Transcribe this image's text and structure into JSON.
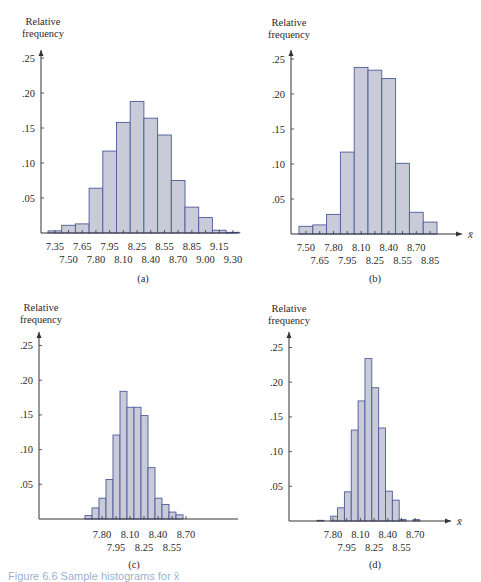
{
  "colors": {
    "bar_fill": "#c9ccd8",
    "bar_stroke": "#4a5a9c",
    "axis": "#333333",
    "caption": "#4a6fb0"
  },
  "figure_caption": "Figure 6.6 Sample histograms for x̄",
  "panels": [
    {
      "id": "a",
      "label": "(a)",
      "ylabel_line1": "Relative",
      "ylabel_line2": "frequency",
      "xsymbol": "x̄"
    },
    {
      "id": "b",
      "label": "(b)",
      "ylabel_line1": "Relative",
      "ylabel_line2": "frequency",
      "xsymbol": "x̄"
    },
    {
      "id": "c",
      "label": "(c)",
      "ylabel_line1": "Relative",
      "ylabel_line2": "frequency",
      "xsymbol": "x̄"
    },
    {
      "id": "d",
      "label": "(d)",
      "ylabel_line1": "Relative",
      "ylabel_line2": "frequency",
      "xsymbol": "x̄"
    }
  ],
  "chart_data": [
    {
      "type": "bar",
      "title": "(a)",
      "xlabel": "x̄",
      "ylabel": "Relative frequency",
      "ylim": [
        0,
        0.27
      ],
      "yticks": [
        ".05",
        ".10",
        ".15",
        ".20",
        ".25"
      ],
      "xticks_top": [
        "7.35",
        "7.65",
        "7.95",
        "8.25",
        "8.55",
        "8.85",
        "9.15"
      ],
      "xticks_bottom": [
        "7.50",
        "7.80",
        "8.10",
        "8.40",
        "8.70",
        "9.00",
        "9.30"
      ],
      "bin_start": 7.275,
      "bin_width": 0.15,
      "categories": [
        "7.35",
        "7.50",
        "7.65",
        "7.80",
        "7.95",
        "8.10",
        "8.25",
        "8.40",
        "8.55",
        "8.70",
        "8.85",
        "9.00",
        "9.15",
        "9.30"
      ],
      "values": [
        0.003,
        0.011,
        0.013,
        0.064,
        0.117,
        0.158,
        0.188,
        0.164,
        0.14,
        0.075,
        0.037,
        0.022,
        0.004,
        0.001
      ]
    },
    {
      "type": "bar",
      "title": "(b)",
      "xlabel": "x̄",
      "ylabel": "Relative frequency",
      "ylim": [
        0,
        0.27
      ],
      "yticks": [
        ".05",
        ".10",
        ".15",
        ".20",
        ".25"
      ],
      "xticks_top": [
        "7.50",
        "7.80",
        "8.10",
        "8.40",
        "8.70"
      ],
      "xticks_bottom": [
        "7.65",
        "7.95",
        "8.25",
        "8.55",
        "8.85"
      ],
      "bin_start": 7.425,
      "bin_width": 0.15,
      "categories": [
        "7.50",
        "7.65",
        "7.80",
        "7.95",
        "8.10",
        "8.25",
        "8.40",
        "8.55",
        "8.70",
        "8.85"
      ],
      "values": [
        0.011,
        0.013,
        0.028,
        0.117,
        0.238,
        0.234,
        0.222,
        0.101,
        0.031,
        0.017
      ]
    },
    {
      "type": "bar",
      "title": "(c)",
      "xlabel": "x̄",
      "ylabel": "Relative frequency",
      "ylim": [
        0,
        0.27
      ],
      "yticks": [
        ".05",
        ".10",
        ".15",
        ".20",
        ".25"
      ],
      "xticks_top": [
        "7.80",
        "8.10",
        "8.40",
        "8.70"
      ],
      "xticks_bottom": [
        "7.95",
        "8.25",
        "8.55"
      ],
      "bin_start": 7.725,
      "bin_width": 0.075,
      "categories": [
        "7.76",
        "7.84",
        "7.91",
        "7.99",
        "8.06",
        "8.14",
        "8.21",
        "8.29",
        "8.36",
        "8.44",
        "8.51",
        "8.59",
        "8.66",
        "8.74"
      ],
      "values": [
        0.005,
        0.016,
        0.03,
        0.057,
        0.121,
        0.184,
        0.161,
        0.161,
        0.149,
        0.074,
        0.03,
        0.021,
        0.01,
        0.006
      ]
    },
    {
      "type": "bar",
      "title": "(d)",
      "xlabel": "x̄",
      "ylabel": "Relative frequency",
      "ylim": [
        0,
        0.27
      ],
      "yticks": [
        ".05",
        ".10",
        ".15",
        ".20",
        ".25"
      ],
      "xticks_top": [
        "7.80",
        "8.10",
        "8.40",
        "8.70"
      ],
      "xticks_bottom": [
        "7.95",
        "8.25",
        "8.55"
      ],
      "bin_start": 7.65,
      "bin_width": 0.075,
      "categories": [
        "7.69",
        "7.76",
        "7.84",
        "7.91",
        "7.99",
        "8.06",
        "8.14",
        "8.21",
        "8.29",
        "8.36",
        "8.44",
        "8.51",
        "8.59",
        "8.66",
        "8.74"
      ],
      "values": [
        0.001,
        0.0,
        0.007,
        0.019,
        0.042,
        0.131,
        0.173,
        0.234,
        0.192,
        0.134,
        0.043,
        0.03,
        0.002,
        0.0,
        0.002
      ]
    }
  ]
}
